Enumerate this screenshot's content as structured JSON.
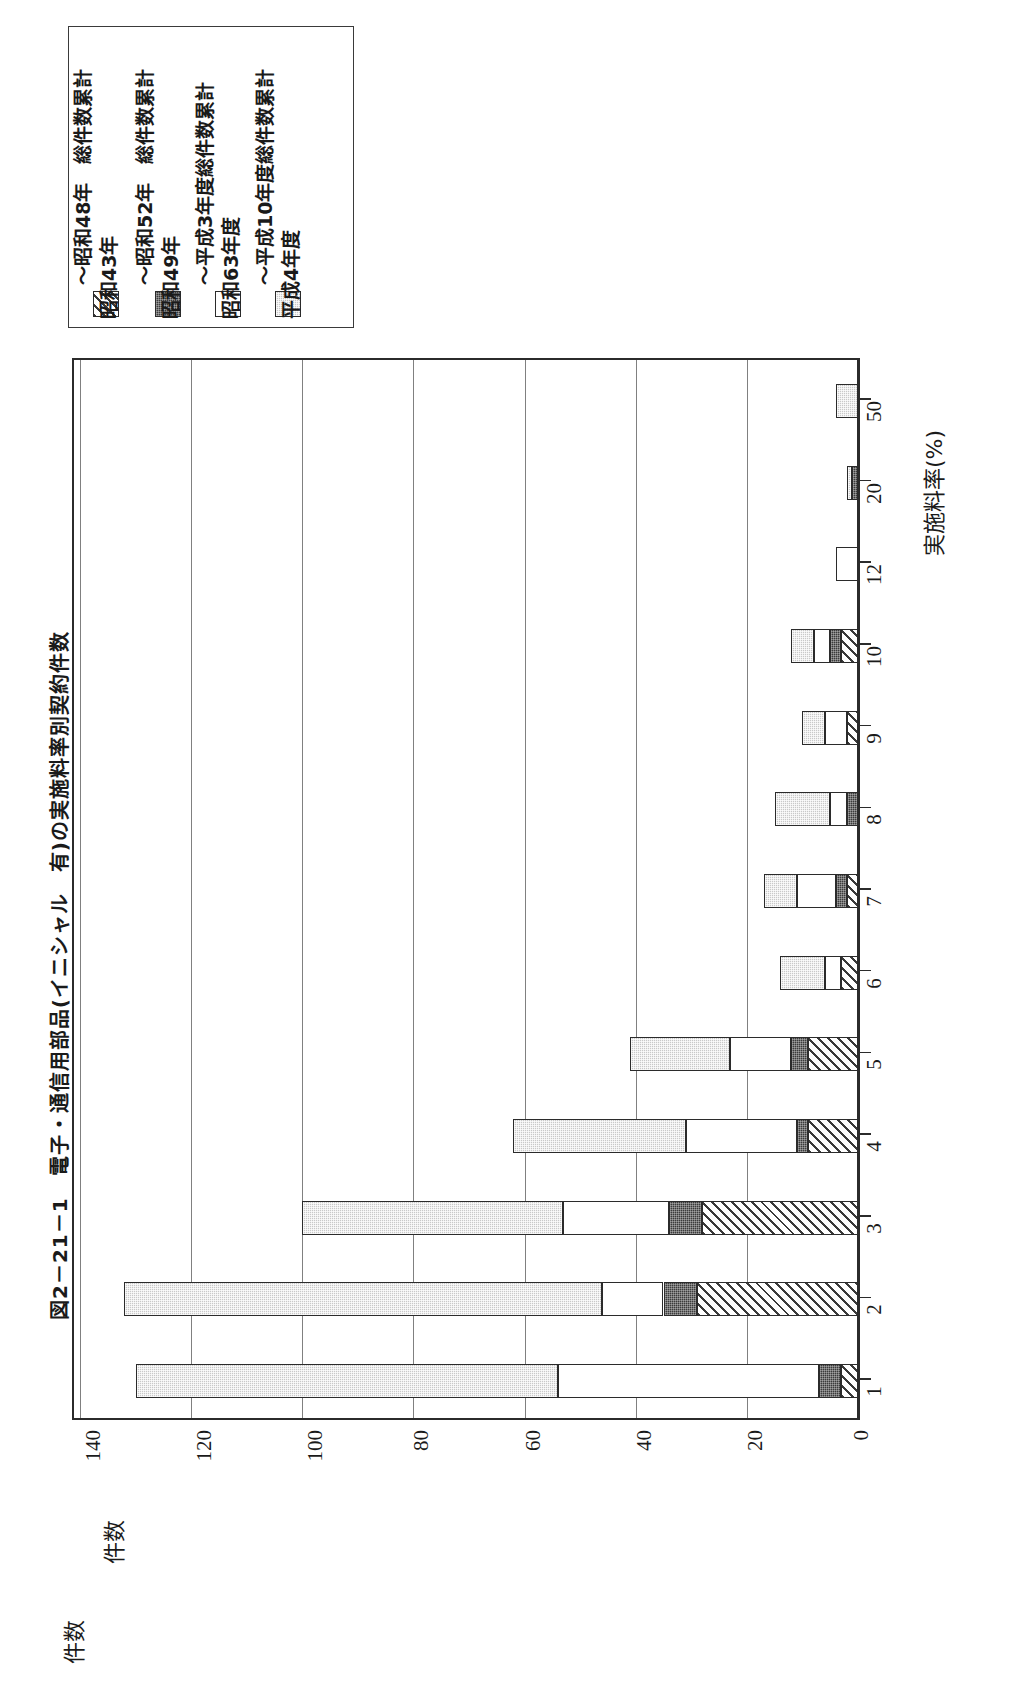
{
  "title": "図2－21－1　電子・通信用部品(イニシャル　有)の実施料率別契約件数",
  "legend": {
    "items": [
      {
        "key": "h4",
        "label": "平成4年度",
        "label2": "～平成10年度総件数累計",
        "swatch": "light-dotted-gray"
      },
      {
        "key": "s63",
        "label": "昭和63年度",
        "label2": "～平成3年度総件数累計",
        "swatch": "white"
      },
      {
        "key": "s49",
        "label": "昭和49年",
        "label2": "～昭和52年　総件数累計",
        "swatch": "dark-solid"
      },
      {
        "key": "s43",
        "label": "昭和43年",
        "label2": "～昭和48年　総件数累計",
        "swatch": "diagonal-hatch"
      }
    ]
  },
  "axes": {
    "category_axis_title": "実施料率(%)",
    "value_axis_title": "件数",
    "value_axis_title_repeat": "件数",
    "value_ticks": [
      "0",
      "20",
      "40",
      "60",
      "80",
      "100",
      "120",
      "140"
    ]
  },
  "colors": {
    "series_h4": "#c9c9c9",
    "series_s63": "#ffffff",
    "series_s49": "#3b3b3b",
    "series_s43": "#ffffff",
    "outline": "#2b2b2b",
    "grid": "#808080",
    "background": "#ffffff"
  },
  "chart_data": {
    "type": "bar",
    "orientation": "horizontal-stacked",
    "title": "図2－21－1　電子・通信用部品(イニシャル　有)の実施料率別契約件数",
    "xlabel": "件数",
    "ylabel": "実施料率(%)",
    "xlim": [
      0,
      140
    ],
    "xticks": [
      0,
      20,
      40,
      60,
      80,
      100,
      120,
      140
    ],
    "grid": true,
    "legend_position": "top-left",
    "categories": [
      "1",
      "2",
      "3",
      "4",
      "5",
      "6",
      "7",
      "8",
      "9",
      "10",
      "12",
      "20",
      "50"
    ],
    "series": [
      {
        "name": "昭和43年～昭和48年　総件数累計",
        "fill": "diagonal-hatch",
        "values": [
          3,
          29,
          28,
          9,
          9,
          3,
          2,
          0,
          2,
          3,
          0,
          0,
          0
        ]
      },
      {
        "name": "昭和49年～昭和52年　総件数累計",
        "fill": "dark-solid",
        "values": [
          4,
          6,
          6,
          2,
          3,
          0,
          2,
          2,
          0,
          2,
          0,
          1,
          0
        ]
      },
      {
        "name": "昭和63年度～平成3年度総件数累計",
        "fill": "white",
        "values": [
          47,
          11,
          19,
          20,
          11,
          3,
          7,
          3,
          4,
          3,
          4,
          0,
          0
        ]
      },
      {
        "name": "平成4年度～平成10年度総件数累計",
        "fill": "light-dotted-gray",
        "values": [
          76,
          86,
          47,
          31,
          18,
          8,
          6,
          10,
          4,
          4,
          0,
          1,
          4
        ]
      }
    ],
    "totals": [
      130,
      132,
      100,
      62,
      41,
      14,
      17,
      15,
      10,
      12,
      4,
      2,
      4
    ]
  }
}
